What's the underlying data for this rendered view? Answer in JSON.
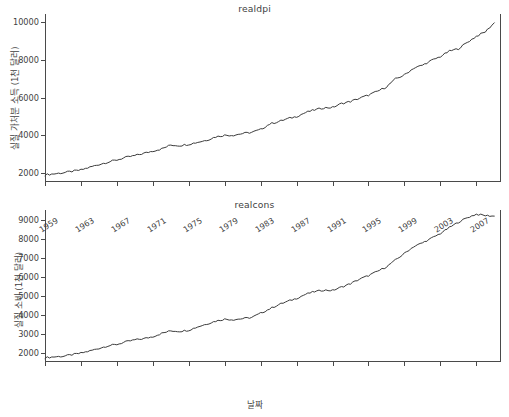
{
  "figure": {
    "width": 509,
    "height": 417,
    "background": "#ffffff",
    "line_color": "#3b3b3b",
    "axis_color": "#4a4a4a",
    "text_color": "#3f3f3f"
  },
  "xlabel": "날짜",
  "chart_data": [
    {
      "type": "line",
      "title": "realdpi",
      "xlabel": "",
      "ylabel": "실질 가처분 소득 (1천 달러)",
      "grid": false,
      "legend": null,
      "xlim": [
        1959.0,
        2009.75
      ],
      "ylim": [
        1500,
        10450
      ],
      "yticks": [
        2000,
        4000,
        6000,
        8000,
        10000
      ],
      "ytick_labels": [
        "2000",
        "4000",
        "6000",
        "8000",
        "10000"
      ],
      "xticks": [
        1959,
        1963,
        1967,
        1971,
        1975,
        1979,
        1983,
        1987,
        1991,
        1995,
        1999,
        2003,
        2007
      ],
      "xtick_labels": [],
      "x": [
        1959,
        1960,
        1961,
        1962,
        1963,
        1964,
        1965,
        1966,
        1967,
        1968,
        1969,
        1970,
        1971,
        1972,
        1973,
        1974,
        1975,
        1976,
        1977,
        1978,
        1979,
        1980,
        1981,
        1982,
        1983,
        1984,
        1985,
        1986,
        1987,
        1988,
        1989,
        1990,
        1991,
        1992,
        1993,
        1994,
        1995,
        1996,
        1997,
        1998,
        1999,
        2000,
        2001,
        2002,
        2003,
        2004,
        2005,
        2006,
        2007,
        2008,
        2009
      ],
      "values": [
        1886,
        1934,
        1990,
        2065,
        2140,
        2288,
        2432,
        2560,
        2674,
        2810,
        2905,
        3027,
        3151,
        3268,
        3470,
        3440,
        3510,
        3620,
        3730,
        3907,
        3990,
        3995,
        4085,
        4145,
        4295,
        4590,
        4720,
        4870,
        4990,
        5200,
        5340,
        5450,
        5470,
        5680,
        5790,
        5960,
        6130,
        6330,
        6570,
        6990,
        7200,
        7560,
        7720,
        7970,
        8180,
        8470,
        8600,
        8940,
        9260,
        9500,
        9980
      ],
      "notes": "Quarterly series 1959Q1-2009Q3; annual means shown; upward trend from ~1886 to ~10000 thousand dollars"
    },
    {
      "type": "line",
      "title": "realcons",
      "xlabel": "날짜",
      "ylabel": "실질 소비 (1천 달러)",
      "grid": false,
      "legend": null,
      "xlim": [
        1959.0,
        2009.75
      ],
      "ylim": [
        1550,
        9500
      ],
      "yticks": [
        2000,
        3000,
        4000,
        5000,
        6000,
        7000,
        8000,
        9000
      ],
      "ytick_labels": [
        "2000",
        "3000",
        "4000",
        "5000",
        "6000",
        "7000",
        "8000",
        "9000"
      ],
      "xticks": [
        1959,
        1963,
        1967,
        1971,
        1975,
        1979,
        1983,
        1987,
        1991,
        1995,
        1999,
        2003,
        2007
      ],
      "xtick_labels": [
        "1959",
        "1963",
        "1967",
        "1971",
        "1975",
        "1979",
        "1983",
        "1987",
        "1991",
        "1995",
        "1999",
        "2003",
        "2007"
      ],
      "x": [
        1959,
        1960,
        1961,
        1962,
        1963,
        1964,
        1965,
        1966,
        1967,
        1968,
        1969,
        1970,
        1971,
        1972,
        1973,
        1974,
        1975,
        1976,
        1977,
        1978,
        1979,
        1980,
        1981,
        1982,
        1983,
        1984,
        1985,
        1986,
        1987,
        1988,
        1989,
        1990,
        1991,
        1992,
        1993,
        1994,
        1995,
        1996,
        1997,
        1998,
        1999,
        2000,
        2001,
        2002,
        2003,
        2004,
        2005,
        2006,
        2007,
        2008,
        2009
      ],
      "values": [
        1778,
        1819,
        1849,
        1930,
        2013,
        2129,
        2263,
        2396,
        2468,
        2605,
        2708,
        2771,
        2877,
        3050,
        3180,
        3155,
        3215,
        3390,
        3540,
        3690,
        3790,
        3765,
        3820,
        3880,
        4100,
        4330,
        4550,
        4720,
        4880,
        5090,
        5230,
        5310,
        5290,
        5470,
        5650,
        5880,
        6070,
        6290,
        6530,
        6880,
        7230,
        7580,
        7780,
        8020,
        8270,
        8580,
        8860,
        9100,
        9280,
        9210,
        9180
      ],
      "notes": "Quarterly series 1959Q1-2009Q3; rises from ~1778 to a peak ~9300 around 2007-2008 then dips slightly"
    }
  ]
}
